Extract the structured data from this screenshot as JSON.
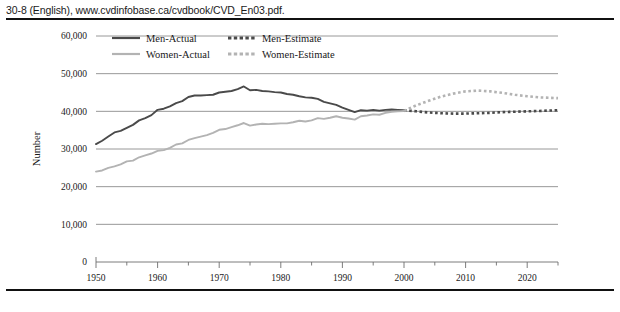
{
  "header": {
    "source_line": "30-8 (English), www.cvdinfobase.ca/cvdbook/CVD_En03.pdf."
  },
  "colors": {
    "men": "#4a4a4a",
    "women": "#b3b3b3",
    "gridline": "#8c8c8c",
    "axis": "#6e6e6e",
    "text": "#1a1a1a",
    "rule": "#111111",
    "background": "#ffffff"
  },
  "legend": {
    "position": "top-inside",
    "entries": [
      {
        "label": "Men-Actual",
        "series": "men_actual",
        "style": "solid",
        "color": "#4a4a4a"
      },
      {
        "label": "Men-Estimate",
        "series": "men_estimate",
        "style": "dashed",
        "color": "#4a4a4a"
      },
      {
        "label": "Women-Actual",
        "series": "women_actual",
        "style": "solid",
        "color": "#b3b3b3"
      },
      {
        "label": "Women-Estimate",
        "series": "women_estimate",
        "style": "dashed",
        "color": "#b3b3b3"
      }
    ]
  },
  "chart_data": {
    "type": "line",
    "title": "",
    "xlabel": "",
    "ylabel": "Number",
    "xlim": [
      1950,
      2025
    ],
    "ylim": [
      0,
      60000
    ],
    "ytick_values": [
      0,
      10000,
      20000,
      30000,
      40000,
      50000,
      60000
    ],
    "ytick_labels": [
      "0",
      "10,000",
      "20,000",
      "30,000",
      "40,000",
      "50,000",
      "60,000"
    ],
    "xtick_labels": [
      "1950",
      "1960",
      "1970",
      "1980",
      "1990",
      "2000",
      "2010",
      "2020"
    ],
    "xtick_values": [
      1950,
      1960,
      1970,
      1980,
      1990,
      2000,
      2010,
      2020
    ],
    "xminor_step": 5,
    "grid": "horizontal",
    "series": [
      {
        "name": "Men-Actual",
        "style": "solid",
        "color": "#4a4a4a",
        "x": [
          1950,
          1951,
          1952,
          1953,
          1954,
          1955,
          1956,
          1957,
          1958,
          1959,
          1960,
          1961,
          1962,
          1963,
          1964,
          1965,
          1966,
          1967,
          1968,
          1969,
          1970,
          1971,
          1972,
          1973,
          1974,
          1975,
          1976,
          1977,
          1978,
          1979,
          1980,
          1981,
          1982,
          1983,
          1984,
          1985,
          1986,
          1987,
          1988,
          1989,
          1990,
          1991,
          1992,
          1993,
          1994,
          1995,
          1996,
          1997,
          1998,
          1999,
          2000
        ],
        "values": [
          31300,
          32200,
          33300,
          34400,
          34800,
          35600,
          36400,
          37600,
          38200,
          39000,
          40400,
          40700,
          41300,
          42200,
          42700,
          43800,
          44200,
          44200,
          44300,
          44400,
          45000,
          45200,
          45400,
          45900,
          46600,
          45600,
          45700,
          45400,
          45300,
          45100,
          45000,
          44600,
          44400,
          44000,
          43700,
          43600,
          43300,
          42500,
          42100,
          41700,
          41000,
          40400,
          39800,
          40300,
          40200,
          40400,
          40200,
          40400,
          40500,
          40400,
          40300
        ]
      },
      {
        "name": "Women-Actual",
        "style": "solid",
        "color": "#b3b3b3",
        "x": [
          1950,
          1951,
          1952,
          1953,
          1954,
          1955,
          1956,
          1957,
          1958,
          1959,
          1960,
          1961,
          1962,
          1963,
          1964,
          1965,
          1966,
          1967,
          1968,
          1969,
          1970,
          1971,
          1972,
          1973,
          1974,
          1975,
          1976,
          1977,
          1978,
          1979,
          1980,
          1981,
          1982,
          1983,
          1984,
          1985,
          1986,
          1987,
          1988,
          1989,
          1990,
          1991,
          1992,
          1993,
          1994,
          1995,
          1996,
          1997,
          1998,
          1999,
          2000
        ],
        "values": [
          24000,
          24300,
          25000,
          25400,
          25900,
          26700,
          26900,
          27800,
          28300,
          28800,
          29500,
          29700,
          30300,
          31200,
          31500,
          32400,
          32900,
          33300,
          33700,
          34300,
          35100,
          35300,
          35800,
          36300,
          36900,
          36200,
          36500,
          36700,
          36600,
          36700,
          36800,
          36800,
          37100,
          37500,
          37300,
          37600,
          38200,
          38000,
          38300,
          38700,
          38300,
          38100,
          37800,
          38700,
          38900,
          39200,
          39100,
          39600,
          39900,
          40000,
          40100
        ]
      },
      {
        "name": "Men-Estimate",
        "style": "dashed",
        "color": "#4a4a4a",
        "x": [
          2000,
          2002,
          2004,
          2006,
          2008,
          2010,
          2012,
          2014,
          2016,
          2018,
          2020,
          2022,
          2025
        ],
        "values": [
          40300,
          40000,
          39700,
          39500,
          39400,
          39400,
          39500,
          39600,
          39800,
          39900,
          40000,
          40100,
          40300
        ]
      },
      {
        "name": "Women-Estimate",
        "style": "dashed",
        "color": "#b3b3b3",
        "x": [
          2000,
          2002,
          2004,
          2006,
          2008,
          2010,
          2012,
          2014,
          2016,
          2018,
          2020,
          2022,
          2025
        ],
        "values": [
          40100,
          41600,
          42800,
          43900,
          44700,
          45300,
          45500,
          45300,
          44900,
          44400,
          44000,
          43700,
          43500
        ]
      }
    ]
  }
}
